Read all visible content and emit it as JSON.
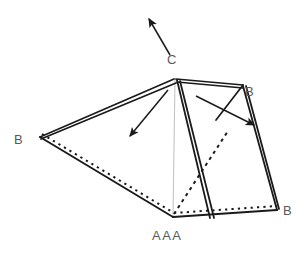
{
  "figure": {
    "labels": {
      "apex": "C",
      "left_vertex": "B",
      "upper_right_vertex": "B",
      "bottom_right_vertex": "B",
      "front_bottom_vertex": "AAA"
    },
    "colors": {
      "stroke": "#1a1a1a",
      "text": "#595959",
      "axis_line": "#c4c4c4",
      "background": "#ffffff"
    },
    "geometry": {
      "apex": [
        175,
        78
      ],
      "back_right": [
        243,
        85
      ],
      "left": [
        40,
        137
      ],
      "front_bottom": [
        173,
        217
      ],
      "right_bottom": [
        277,
        210
      ]
    },
    "arrows": [
      {
        "name": "arrow-up-left-from-apex",
        "from": [
          170,
          55
        ],
        "to": [
          147,
          16
        ]
      },
      {
        "name": "arrow-down-left-front-face",
        "from": [
          168,
          90
        ],
        "to": [
          128,
          139
        ]
      },
      {
        "name": "arrow-down-right-side-face",
        "from": [
          196,
          96
        ],
        "to": [
          257,
          127
        ]
      }
    ]
  }
}
